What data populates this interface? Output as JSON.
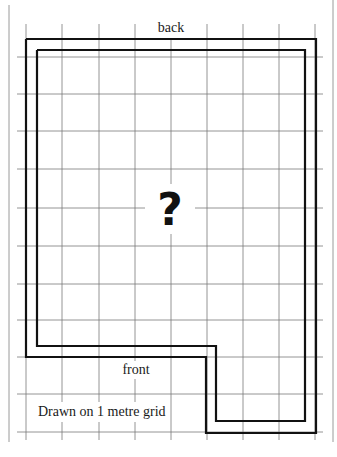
{
  "diagram": {
    "type": "floor-plan",
    "labels": {
      "top": "back",
      "bottom": "front",
      "center": "?",
      "note": "Drawn on 1 metre grid"
    },
    "grid_unit": "1 metre",
    "grid_columns_x": [
      26,
      62,
      99,
      135,
      171,
      207,
      243,
      279,
      315
    ],
    "grid_rows_y": [
      57,
      94,
      131,
      169,
      208,
      246,
      284,
      320,
      357,
      394,
      432
    ],
    "colors": {
      "background": "#ffffff",
      "grid": "#7a7a7a",
      "wall": "#111111",
      "text": "#1a1a1a"
    },
    "shape": "L-shaped room (wider at back, notch cut out at front-left)"
  }
}
